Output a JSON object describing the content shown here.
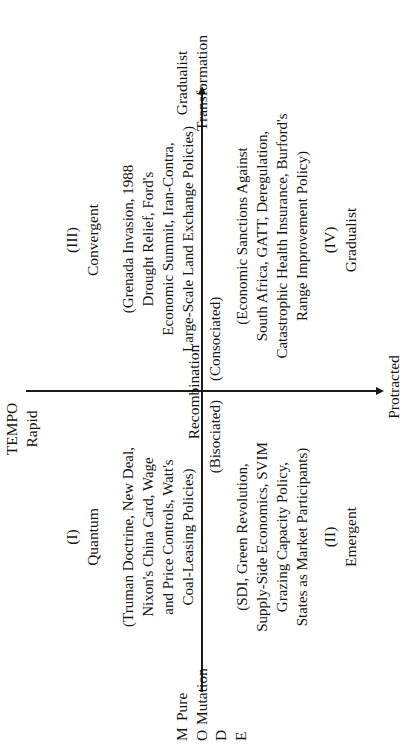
{
  "figure": {
    "type": "2x2-matrix",
    "axes": {
      "vertical": {
        "title": "TEMPO",
        "top_label": "Rapid",
        "bottom_label": "Protracted",
        "direction": "downward-arrow"
      },
      "horizontal": {
        "title_letters": [
          "M",
          "O",
          "D",
          "E"
        ],
        "title": "MODE",
        "left_label_line1": "Pure",
        "left_label_line2": "Mutation",
        "center_label": "Recombination",
        "center_sub_left": "(Bisociated)",
        "center_sub_right": "(Consociated)",
        "right_label_line1": "Gradualist",
        "right_label_line2": "Transformation",
        "direction": "rightward-arrow"
      }
    },
    "quadrants": [
      {
        "numeral": "(I)",
        "name": "Quantum",
        "examples": "(Truman Doctrine, New Deal,\nNixon's China Card, Wage\nand Price Controls, Watt's\nCoal-Leasing Policies)",
        "position": "top-left"
      },
      {
        "numeral": "(II)",
        "name": "Emergent",
        "examples": "(SDI, Green Revolution,\nSupply-Side Economics, SVIM\nGrazing Capacity Policy,\nStates as Market Participants)",
        "position": "bottom-left"
      },
      {
        "numeral": "(III)",
        "name": "Convergent",
        "examples": "(Grenada Invasion, 1988\nDrought Relief, Ford's\nEconomic Summit, Iran-Contra,\nLarge-Scale Land Exchange Policies)",
        "position": "top-right"
      },
      {
        "numeral": "(IV)",
        "name": "Gradualist",
        "examples": "(Economic Sanctions Against\nSouth Africa, GATT, Deregulation,\nCatastrophic Health Insurance, Burford's\nRange Improvement Policy)",
        "position": "bottom-right"
      }
    ],
    "colors": {
      "ink": "#15130f",
      "rule": "#1a1a1a",
      "paper": "#ffffff"
    }
  }
}
